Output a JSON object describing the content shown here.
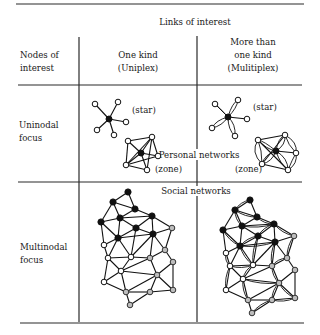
{
  "figure": {
    "column_group_header": "Links of interest",
    "row_header": [
      "Nodes of",
      "interest"
    ],
    "columns": [
      {
        "label_lines": [
          "One kind",
          "(Uniplex)"
        ]
      },
      {
        "label_lines": [
          "More than",
          "one kind",
          "(Mulitiplex)"
        ]
      }
    ],
    "rows": [
      {
        "label_lines": [
          "Uninodal",
          "focus"
        ]
      },
      {
        "label_lines": [
          "Multinodal",
          "focus"
        ]
      }
    ],
    "annotations": {
      "star": "(star)",
      "zone": "(zone)",
      "personal_networks": "Personal networks",
      "social_networks": "Social networks"
    },
    "node_legend": {
      "black": "#111111",
      "white": "#ffffff",
      "gray": "#bdbdbd"
    }
  }
}
